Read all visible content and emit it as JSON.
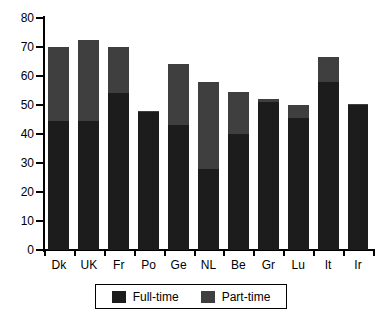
{
  "chart_data": {
    "type": "bar",
    "subtype": "stacked-bar",
    "title": "",
    "xlabel": "",
    "ylabel": "",
    "ylim": [
      0,
      80
    ],
    "ytick_step": 10,
    "yticks": [
      0,
      10,
      20,
      30,
      40,
      50,
      60,
      70,
      80
    ],
    "grid": false,
    "legend_position": "bottom-center",
    "categories": [
      "Dk",
      "UK",
      "Fr",
      "Po",
      "Ge",
      "NL",
      "Be",
      "Gr",
      "Lu",
      "It",
      "Ir"
    ],
    "series": [
      {
        "name": "Full-time",
        "color": "#1c1c1c",
        "values": [
          44.5,
          44.5,
          54,
          47.5,
          43,
          28,
          40,
          51,
          45.5,
          58,
          50
        ]
      },
      {
        "name": "Part-time",
        "color": "#3f3f3f",
        "values": [
          25.5,
          28,
          16,
          0.5,
          21,
          30,
          14.5,
          1,
          4.5,
          8.5,
          0.5
        ]
      }
    ],
    "totals": [
      70,
      72.5,
      70,
      48,
      64,
      58,
      54.5,
      52,
      50,
      66.5,
      50.5
    ]
  },
  "axis": {
    "y_tick_labels": [
      "80",
      "70",
      "60",
      "50",
      "40",
      "30",
      "20",
      "10",
      "0"
    ],
    "x_tick_labels": [
      "Dk",
      "UK",
      "Fr",
      "Po",
      "Ge",
      "NL",
      "Be",
      "Gr",
      "Lu",
      "It",
      "Ir"
    ]
  },
  "legend": {
    "items": [
      {
        "label": "Full-time",
        "color": "#1c1c1c"
      },
      {
        "label": "Part-time",
        "color": "#3f3f3f"
      }
    ]
  },
  "colors": {
    "full_time": "#1c1c1c",
    "part_time": "#3f3f3f",
    "axis": "#000000",
    "background": "#ffffff"
  }
}
